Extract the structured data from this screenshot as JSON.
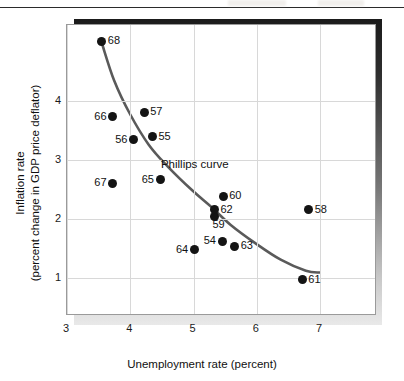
{
  "figure": {
    "background_color": "#ffffff",
    "frame_border_color": "#9a9a9a",
    "gridline_color": "#d8d8d8",
    "point_color": "#141414",
    "curve_color": "#5a5a5a",
    "shadow_color": "#1b1b1b"
  },
  "chart_data": {
    "type": "scatter",
    "title": "",
    "xlabel": "Unemployment rate (percent)",
    "ylabel": "Inflation rate\n(percent change in GDP price deflator)",
    "ylabel_line1": "Inflation rate",
    "ylabel_line2": "(percent change in GDP price deflator)",
    "xlim": [
      3,
      7.9
    ],
    "ylim": [
      0.35,
      5.3
    ],
    "xticks": [
      3,
      4,
      5,
      6,
      7
    ],
    "xtick_labels": [
      "3",
      "4",
      "5",
      "6",
      "7"
    ],
    "yticks": [
      1,
      2,
      3,
      4
    ],
    "ytick_labels": [
      "1",
      "2",
      "3",
      "4"
    ],
    "grid": true,
    "legend": "none",
    "annotations": [
      {
        "text": "Phillips curve",
        "x": 5.02,
        "y": 2.93
      }
    ],
    "series": [
      {
        "name": "U.S. inflation and unemployment, 1954-1968",
        "marker": "circle",
        "points": [
          {
            "label": "54",
            "x": 5.45,
            "y": 1.62,
            "label_position": "left"
          },
          {
            "label": "55",
            "x": 4.35,
            "y": 3.4,
            "label_position": "right"
          },
          {
            "label": "56",
            "x": 4.05,
            "y": 3.35,
            "label_position": "left"
          },
          {
            "label": "57",
            "x": 4.22,
            "y": 3.82,
            "label_position": "right"
          },
          {
            "label": "58",
            "x": 6.82,
            "y": 2.16,
            "label_position": "right"
          },
          {
            "label": "59",
            "x": 5.33,
            "y": 2.04,
            "label_position": "below"
          },
          {
            "label": "60",
            "x": 5.47,
            "y": 2.39,
            "label_position": "right"
          },
          {
            "label": "61",
            "x": 6.72,
            "y": 0.97,
            "label_position": "right"
          },
          {
            "label": "62",
            "x": 5.33,
            "y": 2.16,
            "label_position": "right"
          },
          {
            "label": "63",
            "x": 5.65,
            "y": 1.54,
            "label_position": "right"
          },
          {
            "label": "64",
            "x": 5.01,
            "y": 1.48,
            "label_position": "left"
          },
          {
            "label": "65",
            "x": 4.47,
            "y": 2.67,
            "label_position": "left"
          },
          {
            "label": "66",
            "x": 3.72,
            "y": 3.74,
            "label_position": "left"
          },
          {
            "label": "67",
            "x": 3.72,
            "y": 2.61,
            "label_position": "left"
          },
          {
            "label": "68",
            "x": 3.55,
            "y": 5.02,
            "label_position": "right"
          }
        ]
      }
    ],
    "fit_curve": {
      "name": "Phillips curve",
      "x_start": 3.55,
      "x_end": 7.02,
      "points": [
        {
          "x": 3.56,
          "y": 4.97
        },
        {
          "x": 3.75,
          "y": 4.35
        },
        {
          "x": 4.0,
          "y": 3.78
        },
        {
          "x": 4.3,
          "y": 3.25
        },
        {
          "x": 4.6,
          "y": 2.88
        },
        {
          "x": 5.0,
          "y": 2.46
        },
        {
          "x": 5.3,
          "y": 2.18
        },
        {
          "x": 5.6,
          "y": 1.88
        },
        {
          "x": 6.0,
          "y": 1.56
        },
        {
          "x": 6.4,
          "y": 1.28
        },
        {
          "x": 6.8,
          "y": 1.09
        },
        {
          "x": 7.02,
          "y": 1.06
        }
      ]
    }
  }
}
